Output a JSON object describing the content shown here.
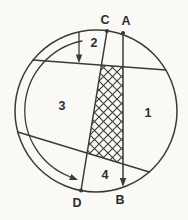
{
  "figure": {
    "points": {
      "C": "C",
      "A": "A",
      "D": "D",
      "B": "B"
    },
    "regions": {
      "r1": "1",
      "r2": "2",
      "r3": "3",
      "r4": "4"
    },
    "colors": {
      "line": "#3a3a3a",
      "label": "#2d2d2d",
      "background": "#faf9f6"
    }
  }
}
